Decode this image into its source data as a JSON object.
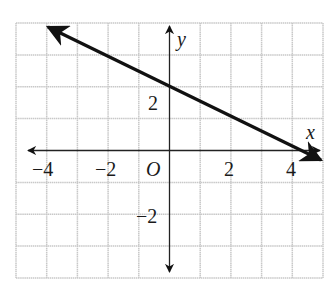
{
  "graph": {
    "x_axis_label": "x",
    "y_axis_label": "y",
    "origin_label": "O",
    "x_ticks": [
      {
        "value": -4,
        "label": "−4"
      },
      {
        "value": -2,
        "label": "−2"
      },
      {
        "value": 2,
        "label": "2"
      },
      {
        "value": 4,
        "label": "4"
      }
    ],
    "y_ticks": [
      {
        "value": 2,
        "label": "2"
      },
      {
        "value": -2,
        "label": "−2"
      }
    ],
    "xlim": [
      -5,
      5
    ],
    "ylim": [
      -4,
      4
    ],
    "grid": true,
    "line": {
      "description": "line through (0, 8/3) and (4, 0) with arrows at both ends",
      "points": [
        [
          -4,
          5.33
        ],
        [
          4.5,
          -0.33
        ]
      ],
      "color": "#111111"
    },
    "grid_color": "#c8c8c8"
  }
}
